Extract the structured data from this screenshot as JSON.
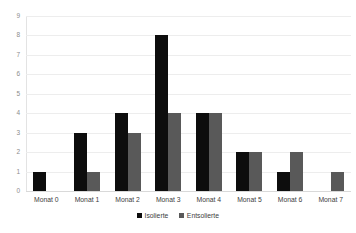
{
  "chart_data": {
    "type": "bar",
    "title": "",
    "subtitle": "",
    "xlabel": "",
    "ylabel": "",
    "categories": [
      "Monat 0",
      "Monat 1",
      "Monat 2",
      "Monat 3",
      "Monat 4",
      "Monat 5",
      "Monat 6",
      "Monat 7"
    ],
    "series": [
      {
        "name": "Isolierte",
        "color": "#0d0d0d",
        "values": [
          1,
          3,
          4,
          8,
          4,
          2,
          1,
          0
        ]
      },
      {
        "name": "Entsolierte",
        "color": "#595959",
        "values": [
          0,
          1,
          3,
          4,
          4,
          2,
          2,
          1
        ]
      }
    ],
    "ylim": [
      0,
      9
    ],
    "yticks": [
      0,
      1,
      2,
      3,
      4,
      5,
      6,
      7,
      8,
      9
    ],
    "ytick_labels": [
      "0",
      "1",
      "2",
      "3",
      "4",
      "5",
      "6",
      "7",
      "8",
      "9"
    ],
    "grid": true,
    "grid_axis": "y",
    "legend": true,
    "legend_position": "bottom",
    "legend_entries": [
      "Isolierte",
      "Entsolierte"
    ],
    "bar_group_mode": "grouped",
    "annotations": []
  },
  "colors": {
    "background": "#ffffff",
    "gridline": "#ededed",
    "baseline": "#d9d9d9",
    "axis_line": "#e3e3e3",
    "tick_text": "#8c8c8c",
    "label_text": "#404040",
    "series_isolierte": "#0d0d0d",
    "series_entsolierte": "#595959"
  }
}
